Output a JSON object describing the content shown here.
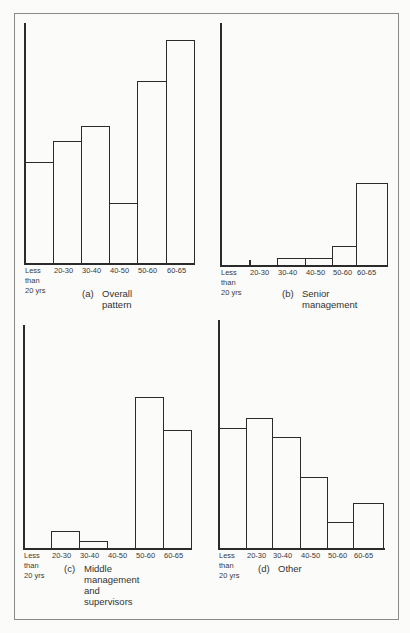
{
  "chart_data": [
    {
      "type": "bar",
      "panel": "a",
      "title": "(a) Overall pattern",
      "caption_tag": "(a)",
      "caption_lines": [
        "Overall",
        "pattern"
      ],
      "categories": [
        "Less than 20 yrs",
        "20-30",
        "30-40",
        "40-50",
        "50-60",
        "60-65"
      ],
      "values": [
        42,
        51,
        57,
        25,
        76,
        93
      ],
      "xlabel": "Age group",
      "ylabel": "",
      "ylim": [
        0,
        100
      ],
      "grid": false,
      "y_ticks_shown": false
    },
    {
      "type": "bar",
      "panel": "b",
      "title": "(b) Senior management",
      "caption_tag": "(b)",
      "caption_lines": [
        "Senior",
        "management"
      ],
      "categories": [
        "Less than 20 yrs",
        "20-30",
        "30-40",
        "40-50",
        "50-60",
        "60-65"
      ],
      "values": [
        0,
        1,
        3,
        3,
        8,
        34
      ],
      "xlabel": "Age group",
      "ylabel": "",
      "ylim": [
        0,
        100
      ],
      "grid": false,
      "y_ticks_shown": false
    },
    {
      "type": "bar",
      "panel": "c",
      "title": "(c) Middle management and supervisors",
      "caption_tag": "(c)",
      "caption_lines": [
        "Middle",
        "management",
        "and",
        "supervisors"
      ],
      "categories": [
        "Less than 20 yrs",
        "20-30",
        "30-40",
        "40-50",
        "50-60",
        "60-65"
      ],
      "values": [
        0,
        7,
        3,
        0,
        64,
        50
      ],
      "xlabel": "Age group",
      "ylabel": "",
      "ylim": [
        0,
        100
      ],
      "grid": false,
      "y_ticks_shown": false
    },
    {
      "type": "bar",
      "panel": "d",
      "title": "(d) Other",
      "caption_tag": "(d)",
      "caption_lines": [
        "Other"
      ],
      "categories": [
        "Less than 20 yrs",
        "20-30",
        "30-40",
        "40-50",
        "50-60",
        "60-65"
      ],
      "values": [
        51,
        55,
        47,
        30,
        11,
        19
      ],
      "xlabel": "Age group",
      "ylabel": "",
      "ylim": [
        0,
        100
      ],
      "grid": false,
      "y_ticks_shown": false
    }
  ],
  "axis_labels": {
    "first_line1": "Less",
    "first_line2": "than",
    "first_line3": "20 yrs",
    "cat2": "20-30",
    "cat3": "30-40",
    "cat4": "40-50",
    "cat5": "50-60",
    "cat6": "60-65"
  }
}
